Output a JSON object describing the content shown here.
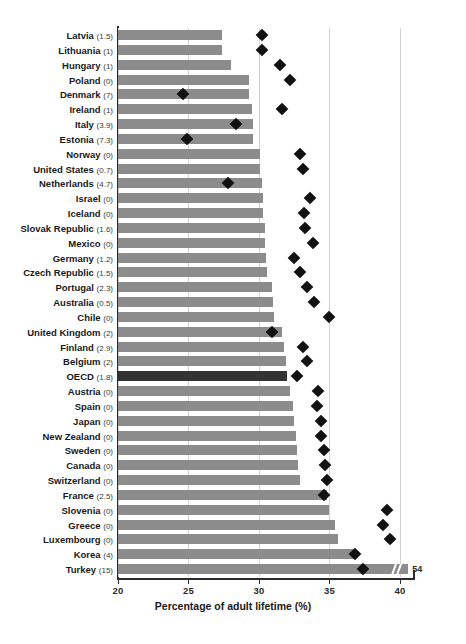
{
  "chart_data": {
    "type": "bar",
    "title": "",
    "xlabel": "Percentage of adult lifetime (%)",
    "ylabel": "",
    "xlim": [
      20,
      41
    ],
    "xticks": [
      20,
      25,
      30,
      35,
      40
    ],
    "grid": true,
    "legend": "none",
    "series": [
      {
        "name": "Percentage of adult lifetime (%)",
        "type": "bar"
      },
      {
        "name": "Marker",
        "type": "scatter"
      }
    ],
    "highlight_category": "OECD",
    "categories": [
      "Latvia",
      "Lithuania",
      "Hungary",
      "Poland",
      "Denmark",
      "Ireland",
      "Italy",
      "Estonia",
      "Norway",
      "United States",
      "Netherlands",
      "Israel",
      "Iceland",
      "Slovak Republic",
      "Mexico",
      "Germany",
      "Czech Republic",
      "Portugal",
      "Australia",
      "Chile",
      "United Kingdom",
      "Finland",
      "Belgium",
      "OECD",
      "Austria",
      "Spain",
      "Japan",
      "New Zealand",
      "Sweden",
      "Canada",
      "Switzerland",
      "France",
      "Slovenia",
      "Greece",
      "Luxembourg",
      "Korea",
      "Turkey"
    ],
    "category_notes": [
      "1.5",
      "1",
      "1",
      "0",
      "7",
      "1",
      "3.9",
      "7.3",
      "0",
      "0.7",
      "4.7",
      "0",
      "0",
      "1.6",
      "0",
      "1.2",
      "1.5",
      "2.3",
      "0.5",
      "0",
      "2",
      "2.9",
      "2",
      "1.8",
      "0",
      "0",
      "0",
      "0",
      "0",
      "0",
      "0",
      "2.5",
      "0",
      "0",
      "0",
      "4",
      "15"
    ],
    "values": [
      27.4,
      27.4,
      28.0,
      29.3,
      29.3,
      29.5,
      29.6,
      29.6,
      30.1,
      30.1,
      30.2,
      30.3,
      30.3,
      30.4,
      30.4,
      30.5,
      30.6,
      30.9,
      31.0,
      31.1,
      31.6,
      31.8,
      31.9,
      32.0,
      32.2,
      32.4,
      32.5,
      32.6,
      32.7,
      32.8,
      32.9,
      34.8,
      35.0,
      35.4,
      35.6,
      36.8,
      54.0
    ],
    "markers": [
      30.2,
      30.2,
      31.5,
      32.2,
      24.6,
      31.6,
      28.4,
      24.9,
      32.9,
      33.1,
      27.8,
      33.6,
      33.2,
      33.3,
      33.8,
      32.5,
      32.9,
      33.4,
      33.9,
      35.0,
      30.9,
      33.1,
      33.4,
      32.7,
      34.2,
      34.1,
      34.4,
      34.4,
      34.6,
      34.7,
      34.8,
      34.6,
      39.1,
      38.8,
      39.3,
      36.8,
      37.4
    ],
    "broken_bar": {
      "category": "Turkey",
      "display_value": "54",
      "drawn_to": 40.6,
      "break_at": 39.3
    },
    "value_labels": [
      "54"
    ]
  }
}
